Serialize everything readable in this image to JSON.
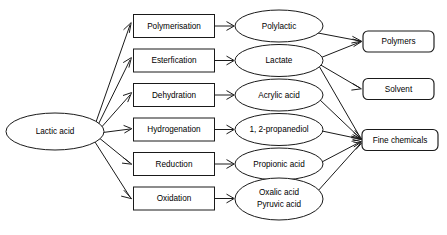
{
  "diagram": {
    "source": {
      "id": "lactic-acid",
      "label": "Lactic acid",
      "shape": "ellipse"
    },
    "processes": [
      {
        "id": "polymerisation",
        "label": "Polymerisation",
        "shape": "rect"
      },
      {
        "id": "esterfication",
        "label": "Esterfication",
        "shape": "rect"
      },
      {
        "id": "dehydration",
        "label": "Dehydration",
        "shape": "rect"
      },
      {
        "id": "hydrogenation",
        "label": "Hydrogenation",
        "shape": "rect"
      },
      {
        "id": "reduction",
        "label": "Reduction",
        "shape": "rect"
      },
      {
        "id": "oxidation",
        "label": "Oxidation",
        "shape": "rect"
      }
    ],
    "products": [
      {
        "id": "polylactic",
        "label": "Polylactic",
        "shape": "ellipse",
        "lines": [
          "Polylactic"
        ]
      },
      {
        "id": "lactate",
        "label": "Lactate",
        "shape": "ellipse",
        "lines": [
          "Lactate"
        ]
      },
      {
        "id": "acrylic-acid",
        "label": "Acrylic acid",
        "shape": "ellipse",
        "lines": [
          "Acrylic acid"
        ]
      },
      {
        "id": "propanediol",
        "label": "1, 2-propanediol",
        "shape": "ellipse",
        "lines": [
          "1, 2-propanediol"
        ]
      },
      {
        "id": "propionic-acid",
        "label": "Propionic acid",
        "shape": "ellipse",
        "lines": [
          "Propionic acid"
        ]
      },
      {
        "id": "oxalic-pyruvic",
        "label": "Oxalic acid Pyruvic acid",
        "shape": "ellipse",
        "lines": [
          "Oxalic acid",
          "Pyruvic acid"
        ]
      }
    ],
    "outcomes": [
      {
        "id": "polymers",
        "label": "Polymers",
        "shape": "rounded-rect"
      },
      {
        "id": "solvent",
        "label": "Solvent",
        "shape": "rounded-rect"
      },
      {
        "id": "fine-chemicals",
        "label": "Fine chemicals",
        "shape": "rounded-rect"
      }
    ],
    "edges": [
      {
        "from": "lactic-acid",
        "to": "polymerisation"
      },
      {
        "from": "lactic-acid",
        "to": "esterfication"
      },
      {
        "from": "lactic-acid",
        "to": "dehydration"
      },
      {
        "from": "lactic-acid",
        "to": "hydrogenation"
      },
      {
        "from": "lactic-acid",
        "to": "reduction"
      },
      {
        "from": "lactic-acid",
        "to": "oxidation"
      },
      {
        "from": "polymerisation",
        "to": "polylactic"
      },
      {
        "from": "esterfication",
        "to": "lactate"
      },
      {
        "from": "dehydration",
        "to": "acrylic-acid"
      },
      {
        "from": "hydrogenation",
        "to": "propanediol"
      },
      {
        "from": "reduction",
        "to": "propionic-acid"
      },
      {
        "from": "oxidation",
        "to": "oxalic-pyruvic"
      },
      {
        "from": "polylactic",
        "to": "polymers"
      },
      {
        "from": "lactate",
        "to": "polymers"
      },
      {
        "from": "lactate",
        "to": "solvent"
      },
      {
        "from": "lactate",
        "to": "fine-chemicals"
      },
      {
        "from": "acrylic-acid",
        "to": "fine-chemicals"
      },
      {
        "from": "propanediol",
        "to": "fine-chemicals"
      },
      {
        "from": "propionic-acid",
        "to": "fine-chemicals"
      },
      {
        "from": "oxalic-pyruvic",
        "to": "fine-chemicals"
      }
    ],
    "colors": {
      "stroke": "#1a1a1a",
      "fill": "#ffffff",
      "text": "#000000",
      "background": "#ffffff"
    }
  }
}
